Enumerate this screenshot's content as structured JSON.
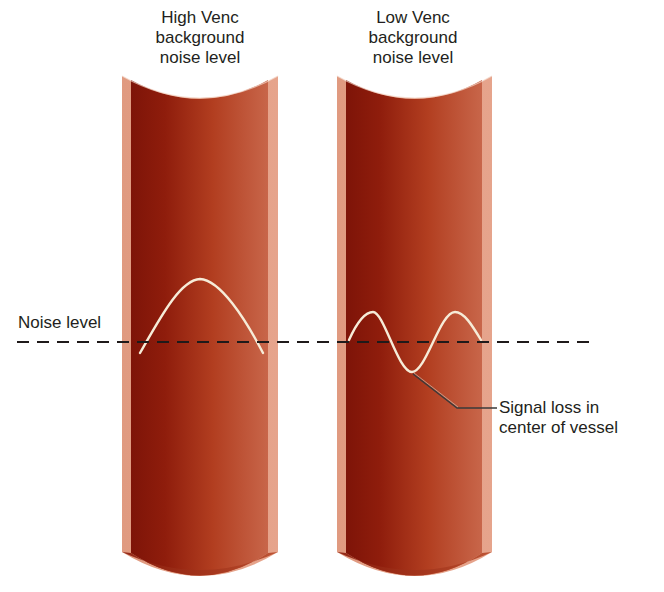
{
  "vessels": [
    {
      "id": "high-venc",
      "title_lines": [
        "High Venc",
        "background",
        "noise level"
      ]
    },
    {
      "id": "low-venc",
      "title_lines": [
        "Low Venc",
        "background",
        "noise level"
      ]
    }
  ],
  "noise_line": {
    "label": "Noise level",
    "style": "dashed"
  },
  "annotation": {
    "lines": [
      "Signal loss in",
      "center of vessel"
    ]
  },
  "colors": {
    "vessel_dark": "#8e1a0c",
    "vessel_mid": "#b23c1e",
    "vessel_light": "#c9684a",
    "vessel_rim": "#e0967d",
    "waveform": "#f6ecd8",
    "dashed_line": "#1f1a1a",
    "text": "#231f20"
  }
}
